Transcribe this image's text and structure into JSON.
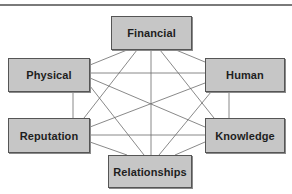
{
  "diagram": {
    "type": "network",
    "colors": {
      "node_fill": "#c6c6c6",
      "node_border": "#555555",
      "line": "#6b6b6b",
      "text": "#1e1e1e"
    },
    "nodes": [
      {
        "id": "financial",
        "label": "Financial",
        "x": 111,
        "y": 16,
        "w": 81,
        "h": 34
      },
      {
        "id": "physical",
        "label": "Physical",
        "x": 8,
        "y": 58,
        "w": 82,
        "h": 34
      },
      {
        "id": "human",
        "label": "Human",
        "x": 205,
        "y": 58,
        "w": 80,
        "h": 34
      },
      {
        "id": "reputation",
        "label": "Reputation",
        "x": 8,
        "y": 118,
        "w": 82,
        "h": 35
      },
      {
        "id": "knowledge",
        "label": "Knowledge",
        "x": 205,
        "y": 118,
        "w": 80,
        "h": 35
      },
      {
        "id": "relationships",
        "label": "Relationships",
        "x": 108,
        "y": 155,
        "w": 84,
        "h": 33
      }
    ],
    "edges": [
      [
        "financial",
        "physical"
      ],
      [
        "financial",
        "human"
      ],
      [
        "financial",
        "reputation"
      ],
      [
        "financial",
        "knowledge"
      ],
      [
        "financial",
        "relationships"
      ],
      [
        "physical",
        "human"
      ],
      [
        "physical",
        "reputation"
      ],
      [
        "physical",
        "knowledge"
      ],
      [
        "physical",
        "relationships"
      ],
      [
        "human",
        "reputation"
      ],
      [
        "human",
        "knowledge"
      ],
      [
        "human",
        "relationships"
      ],
      [
        "reputation",
        "knowledge"
      ],
      [
        "reputation",
        "relationships"
      ],
      [
        "knowledge",
        "relationships"
      ]
    ]
  }
}
